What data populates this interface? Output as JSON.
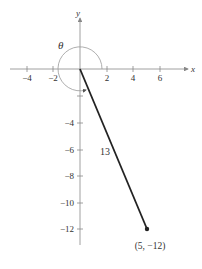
{
  "axes": {
    "x_label": "x",
    "y_label": "y",
    "x_ticks": [
      {
        "value": -4,
        "label": "−4"
      },
      {
        "value": -2,
        "label": "−2"
      },
      {
        "value": 2,
        "label": "2"
      },
      {
        "value": 4,
        "label": "4"
      },
      {
        "value": 6,
        "label": "6"
      }
    ],
    "y_ticks": [
      {
        "value": -4,
        "label": "−4"
      },
      {
        "value": -6,
        "label": "−6"
      },
      {
        "value": -8,
        "label": "−8"
      },
      {
        "value": -10,
        "label": "−10"
      },
      {
        "value": -12,
        "label": "−12"
      }
    ]
  },
  "angle": {
    "label": "θ"
  },
  "segment": {
    "length_label": "13",
    "from": [
      0,
      0
    ],
    "to": [
      5,
      -12
    ]
  },
  "point": {
    "label": "(5,  −12)",
    "x": 5,
    "y": -12
  },
  "colors": {
    "axis": "#888888",
    "segment": "#222222",
    "arc": "#999999"
  }
}
